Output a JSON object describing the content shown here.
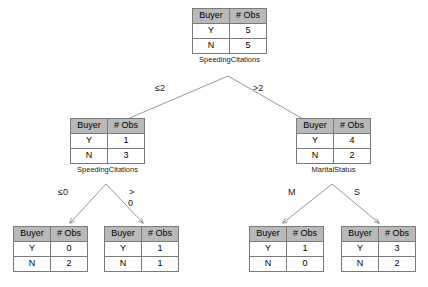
{
  "diagram": {
    "type": "decision-tree",
    "columns": [
      "Buyer",
      "# Obs"
    ],
    "row_keys": [
      "Y",
      "N"
    ],
    "nodes": {
      "root": {
        "header": [
          "Buyer",
          "# Obs"
        ],
        "rows": [
          [
            "Y",
            "5"
          ],
          [
            "N",
            "5"
          ]
        ],
        "split_label": "SpeedingCitations"
      },
      "left": {
        "header": [
          "Buyer",
          "# Obs"
        ],
        "rows": [
          [
            "Y",
            "1"
          ],
          [
            "N",
            "3"
          ]
        ],
        "split_label": "SpeedingCitations"
      },
      "right": {
        "header": [
          "Buyer",
          "# Obs"
        ],
        "rows": [
          [
            "Y",
            "4"
          ],
          [
            "N",
            "2"
          ]
        ],
        "split_label": "MaritalStatus"
      },
      "leaf1": {
        "header": [
          "Buyer",
          "# Obs"
        ],
        "rows": [
          [
            "Y",
            "0"
          ],
          [
            "N",
            "2"
          ]
        ],
        "split_label": ""
      },
      "leaf2": {
        "header": [
          "Buyer",
          "# Obs"
        ],
        "rows": [
          [
            "Y",
            "1"
          ],
          [
            "N",
            "1"
          ]
        ],
        "split_label": ""
      },
      "leaf3": {
        "header": [
          "Buyer",
          "# Obs"
        ],
        "rows": [
          [
            "Y",
            "1"
          ],
          [
            "N",
            "0"
          ]
        ],
        "split_label": ""
      },
      "leaf4": {
        "header": [
          "Buyer",
          "# Obs"
        ],
        "rows": [
          [
            "Y",
            "3"
          ],
          [
            "N",
            "2"
          ]
        ],
        "split_label": ""
      }
    },
    "edges": {
      "root_left": "≤2",
      "root_right": ">2",
      "left_left": "≤0",
      "left_right_line1": ">",
      "left_right_line2": "0",
      "right_left": "M",
      "right_right": "S"
    },
    "colors": {
      "header_fill": "#b9b9b9",
      "border": "#7a7a7a",
      "edge": "#8c8c8c",
      "text": "#1a1a1a",
      "background": "#ffffff"
    }
  }
}
